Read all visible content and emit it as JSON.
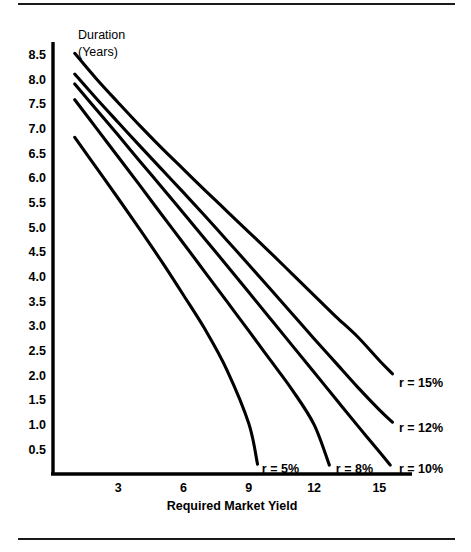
{
  "figure": {
    "has_top_rule": true,
    "has_bottom_rule": true,
    "rule_color": "#1a1a1a"
  },
  "chart_data": {
    "type": "line",
    "title": "",
    "ylabel_lines": [
      "Duration",
      "(Years)"
    ],
    "xlabel": "Required Market Yield",
    "ylabel": "Duration (Years)",
    "xlim": [
      0,
      16.5
    ],
    "ylim": [
      0,
      8.75
    ],
    "grid": false,
    "legend_position": "inline-at-curve-ends",
    "xticks": [
      3,
      6,
      9,
      12,
      15
    ],
    "xtick_labels": [
      "3",
      "6",
      "9",
      "12",
      "15"
    ],
    "yticks": [
      0.5,
      1.0,
      1.5,
      2.0,
      2.5,
      3.0,
      3.5,
      4.0,
      4.5,
      5.0,
      5.5,
      6.0,
      6.5,
      7.0,
      7.5,
      8.0,
      8.5
    ],
    "ytick_labels": [
      "0.5",
      "1.0",
      "1.5",
      "2.0",
      "2.5",
      "3.0",
      "3.5",
      "4.0",
      "4.5",
      "5.0",
      "5.5",
      "6.0",
      "6.5",
      "7.0",
      "7.5",
      "8.0",
      "8.5"
    ],
    "line_color": "#000000",
    "series": [
      {
        "name": "r = 15%",
        "label": "r = 15%",
        "label_anchor_x": 15.9,
        "label_anchor_y": 1.85,
        "x": [
          1.0,
          2.0,
          3.0,
          4.0,
          5.0,
          6.0,
          7.0,
          8.0,
          9.0,
          10.0,
          11.0,
          12.0,
          13.0,
          14.0,
          15.0,
          15.6
        ],
        "y": [
          8.52,
          8.0,
          7.52,
          7.05,
          6.6,
          6.17,
          5.74,
          5.32,
          4.9,
          4.48,
          4.05,
          3.62,
          3.19,
          2.78,
          2.3,
          2.03
        ]
      },
      {
        "name": "r = 12%",
        "label": "r = 12%",
        "label_anchor_x": 15.9,
        "label_anchor_y": 0.95,
        "x": [
          1.0,
          2.0,
          3.0,
          4.0,
          5.0,
          6.0,
          7.0,
          8.0,
          9.0,
          10.0,
          11.0,
          12.0,
          13.0,
          14.0,
          15.0,
          15.6
        ],
        "y": [
          8.1,
          7.6,
          7.12,
          6.64,
          6.17,
          5.7,
          5.22,
          4.73,
          4.24,
          3.74,
          3.24,
          2.74,
          2.25,
          1.76,
          1.3,
          1.05
        ]
      },
      {
        "name": "r = 10%",
        "label": "r = 10%",
        "label_anchor_x": 15.9,
        "label_anchor_y": 0.12,
        "x": [
          1.0,
          2.0,
          3.0,
          4.0,
          5.0,
          6.0,
          7.0,
          8.0,
          9.0,
          10.0,
          11.0,
          12.0,
          13.0,
          14.0,
          15.0,
          15.5
        ],
        "y": [
          7.9,
          7.38,
          6.86,
          6.33,
          5.81,
          5.28,
          4.75,
          4.22,
          3.68,
          3.14,
          2.6,
          2.06,
          1.52,
          0.98,
          0.45,
          0.18
        ]
      },
      {
        "name": "r = 8%",
        "label": "r = 8%",
        "label_anchor_x": 13.0,
        "label_anchor_y": 0.12,
        "x": [
          1.0,
          2.0,
          3.0,
          4.0,
          5.0,
          6.0,
          7.0,
          8.0,
          9.0,
          10.0,
          11.0,
          12.0,
          12.7
        ],
        "y": [
          7.58,
          7.0,
          6.42,
          5.84,
          5.25,
          4.67,
          4.08,
          3.49,
          2.9,
          2.3,
          1.7,
          1.0,
          0.18
        ]
      },
      {
        "name": "r = 5%",
        "label": "r = 5%",
        "label_anchor_x": 9.6,
        "label_anchor_y": 0.12,
        "x": [
          1.0,
          2.0,
          3.0,
          4.0,
          5.0,
          6.0,
          7.0,
          8.0,
          9.0,
          9.4
        ],
        "y": [
          6.82,
          6.2,
          5.58,
          4.95,
          4.3,
          3.62,
          2.92,
          2.1,
          1.02,
          0.2
        ]
      }
    ]
  }
}
